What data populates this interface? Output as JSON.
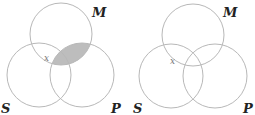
{
  "diagrams": [
    {
      "name": "left-venn",
      "circles": {
        "M": {
          "label": "M",
          "cx": 61,
          "cy": 34,
          "r": 31
        },
        "S": {
          "label": "S",
          "cx": 39,
          "cy": 75,
          "r": 32
        },
        "P": {
          "label": "P",
          "cx": 82,
          "cy": 75,
          "r": 32
        }
      },
      "labels": {
        "M": "M",
        "S": "S",
        "P": "P"
      },
      "marker": "x",
      "shaded_region": "M∩P",
      "shade_color": "#bdbdbd"
    },
    {
      "name": "right-venn",
      "circles": {
        "M": {
          "label": "M",
          "cx": 193,
          "cy": 35,
          "r": 31
        },
        "S": {
          "label": "S",
          "cx": 171,
          "cy": 76,
          "r": 32
        },
        "P": {
          "label": "P",
          "cx": 215,
          "cy": 76,
          "r": 32
        }
      },
      "labels": {
        "M": "M",
        "S": "S",
        "P": "P"
      },
      "marker": "x",
      "shaded_region": "none"
    }
  ],
  "colors": {
    "stroke": "#b8b8b8",
    "shade": "#bdbdbd",
    "text": "#222222"
  }
}
